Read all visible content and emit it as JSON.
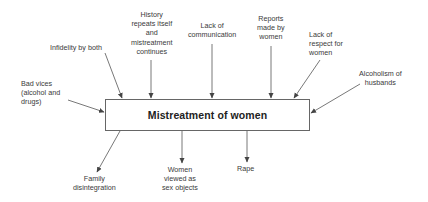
{
  "diagram": {
    "type": "cause-effect",
    "central_node": "Mistreatment of women",
    "causes": [
      {
        "id": "bad-vices",
        "label": "Bad vices\n(alcohol and\ndrugs)"
      },
      {
        "id": "infidelity",
        "label": "Infidelity by both"
      },
      {
        "id": "history",
        "label": "History\nrepeats itself\nand\nmistreatment\ncontinues"
      },
      {
        "id": "lack-communication",
        "label": "Lack of\ncommunication"
      },
      {
        "id": "reports",
        "label": "Reports\nmade by\nwomen"
      },
      {
        "id": "lack-respect",
        "label": "Lack of\nrespect for\nwomen"
      },
      {
        "id": "alcoholism",
        "label": "Alcoholism of\nhusbands"
      }
    ],
    "effects": [
      {
        "id": "family-disintegration",
        "label": "Family\ndisintegration"
      },
      {
        "id": "sex-objects",
        "label": "Women\nviewed as\nsex objects"
      },
      {
        "id": "rape",
        "label": "Rape"
      }
    ],
    "colors": {
      "line": "#555555",
      "text": "#3a3a3a",
      "box_border": "#666666"
    }
  }
}
